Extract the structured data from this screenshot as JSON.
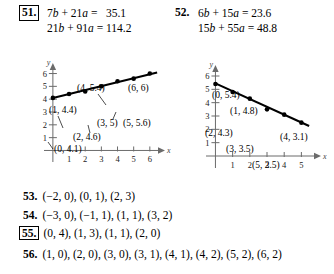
{
  "problems": {
    "p51": {
      "number": "51.",
      "boxed": true,
      "equation1": "7b + 21a =   35.1",
      "equation2": "21b + 91a = 114.2"
    },
    "p52": {
      "number": "52.",
      "boxed": false,
      "equation1": "6b + 15a = 23.6",
      "equation2": "15b + 55a = 48.8"
    }
  },
  "chart_data": [
    {
      "id": "graph1",
      "type": "scatter",
      "title": "",
      "xlabel": "x",
      "ylabel": "y",
      "xlim": [
        -0.55,
        7.0
      ],
      "ylim": [
        -0.9,
        6.9
      ],
      "xticks": [
        1,
        2,
        3,
        4,
        5,
        6
      ],
      "yticks": [
        1,
        2,
        3,
        4,
        5,
        6
      ],
      "grid": false,
      "legend": "none",
      "x": [
        0,
        1,
        2,
        3,
        4,
        5,
        6
      ],
      "y": [
        4.1,
        4.4,
        4.6,
        5.0,
        5.4,
        5.6,
        6.0
      ],
      "point_labels": [
        "(0, 4.1)",
        "(1, 4.4)",
        "(2, 4.6)",
        "(3, 5)",
        "(4, 5.4)",
        "(5, 5.6)",
        "(6, 6)"
      ],
      "fit_line": {
        "from": [
          0,
          4.1
        ],
        "to": [
          6.45,
          6.08
        ]
      }
    },
    {
      "id": "graph2",
      "type": "scatter",
      "title": "",
      "xlabel": "x",
      "ylabel": "y",
      "xlim": [
        -0.55,
        6.2
      ],
      "ylim": [
        -0.9,
        6.9
      ],
      "xticks": [
        1,
        2,
        3,
        4,
        5
      ],
      "yticks": [
        1,
        2,
        3,
        4,
        5,
        6
      ],
      "grid": false,
      "legend": "none",
      "x": [
        0,
        1,
        2,
        3,
        4,
        5
      ],
      "y": [
        5.4,
        4.8,
        4.3,
        3.5,
        3.1,
        2.5
      ],
      "point_labels": [
        "(0, 5.4)",
        "(1, 4.8)",
        "(2, 4.3)",
        "(3, 3.5)",
        "(4, 3.1)",
        "(5, 2.5)"
      ],
      "fit_line": {
        "from": [
          0,
          5.45
        ],
        "to": [
          5.45,
          2.25
        ]
      }
    }
  ],
  "list": [
    {
      "number": "53.",
      "boxed": false,
      "values": "(−2, 0), (0, 1), (2, 3)"
    },
    {
      "number": "54.",
      "boxed": false,
      "values": "(−3, 0), (−1, 1), (1, 1), (3, 2)"
    },
    {
      "number": "55.",
      "boxed": true,
      "values": "(0, 4), (1, 3), (1, 1), (2, 0)"
    },
    {
      "number": "56.",
      "boxed": false,
      "values": "(1, 0), (2, 0), (3, 0), (3, 1), (4, 1), (4, 2), (5, 2), (6, 2)"
    }
  ]
}
